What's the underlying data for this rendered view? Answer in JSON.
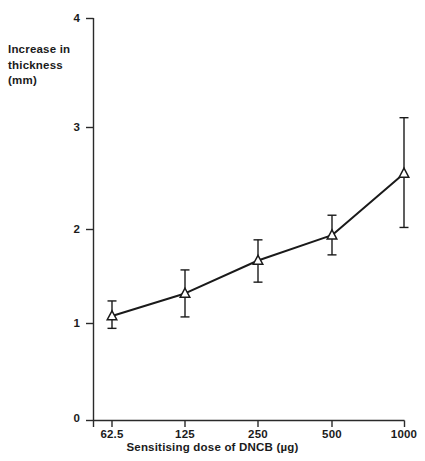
{
  "chart_data": {
    "type": "line",
    "title": "",
    "xlabel": "Sensitising dose of DNCB (µg)",
    "ylabel": "Increase in thickness (mm)",
    "ylabel_lines": [
      "Increase in",
      "thickness",
      "(mm)"
    ],
    "x_scale": "log2-categorical",
    "categories": [
      "62.5",
      "125",
      "250",
      "500",
      "1000"
    ],
    "x_tick_labels": [
      "62.5",
      "125",
      "250",
      "500",
      "1000"
    ],
    "y_tick_labels": [
      "0",
      "1",
      "2",
      "3",
      "4"
    ],
    "y_ticks": [
      0,
      1,
      2,
      3,
      4
    ],
    "ylim": [
      0,
      4
    ],
    "grid": false,
    "legend": false,
    "marker": "open-triangle",
    "line_color": "#1a1a1a",
    "error_bars": "vertical-capped",
    "series": [
      {
        "name": "Increase in thickness",
        "x": [
          62.5,
          125,
          250,
          500,
          1000
        ],
        "values": [
          1.08,
          1.32,
          1.67,
          1.94,
          2.55
        ],
        "err_upper": [
          1.24,
          1.57,
          1.89,
          2.14,
          3.09
        ],
        "err_lower": [
          0.95,
          1.07,
          1.44,
          1.73,
          2.02
        ]
      }
    ]
  },
  "axes": {
    "y_axis_name": "y-axis",
    "x_axis_name": "x-axis"
  }
}
